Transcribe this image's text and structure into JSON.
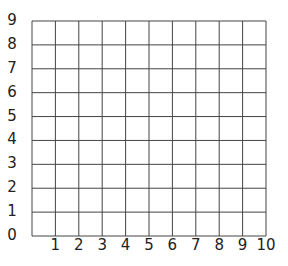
{
  "chart_data": {
    "type": "grid",
    "title": "",
    "xlabel": "",
    "ylabel": "",
    "x_ticks": [
      "1",
      "2",
      "3",
      "4",
      "5",
      "6",
      "7",
      "8",
      "9",
      "10"
    ],
    "y_ticks": [
      "0",
      "1",
      "2",
      "3",
      "4",
      "5",
      "6",
      "7",
      "8",
      "9"
    ],
    "xlim": [
      0,
      10
    ],
    "ylim": [
      0,
      9
    ],
    "grid": true,
    "series": []
  },
  "labels": {
    "x": [
      "1",
      "2",
      "3",
      "4",
      "5",
      "6",
      "7",
      "8",
      "9",
      "10"
    ],
    "y": [
      "0",
      "1",
      "2",
      "3",
      "4",
      "5",
      "6",
      "7",
      "8",
      "9"
    ]
  },
  "colors": {
    "grid_line": "#444444",
    "label": "#222222"
  }
}
